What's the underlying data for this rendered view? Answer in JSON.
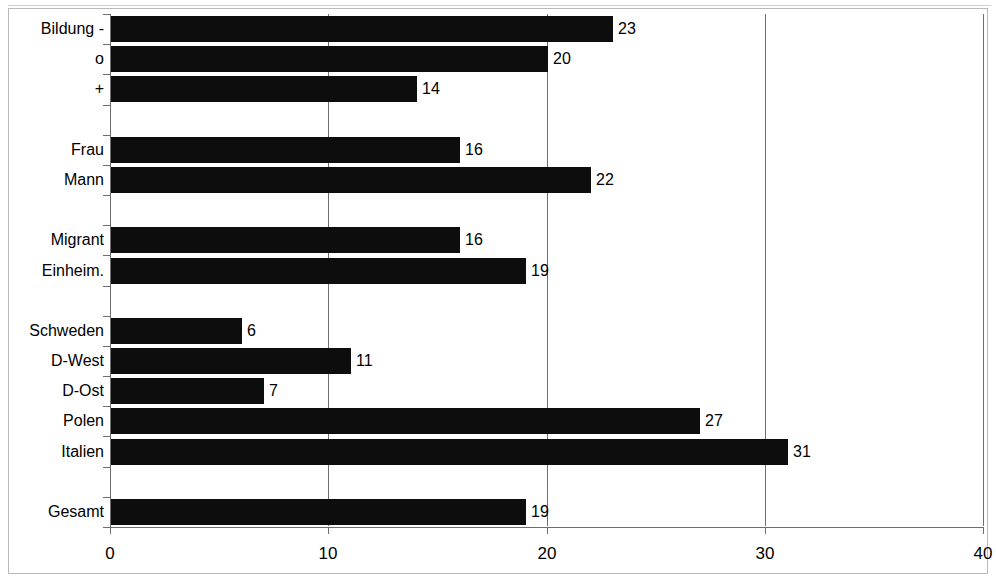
{
  "chart_data": {
    "type": "bar",
    "orientation": "horizontal",
    "title": "",
    "subtitle": "",
    "xlabel": "",
    "ylabel": "",
    "xlim": [
      0,
      40
    ],
    "xticks": [
      "0",
      "10",
      "20",
      "30",
      "40"
    ],
    "xtick_values": [
      0,
      10,
      20,
      30,
      40
    ],
    "grid": "vertical",
    "legend": "none",
    "bar_color": "#0d0d0d",
    "categories": [
      "Bildung -",
      "o",
      "+",
      "",
      "Frau",
      "Mann",
      "",
      "Migrant",
      "Einheim.",
      "",
      "Schweden",
      "D-West",
      "D-Ost",
      "Polen",
      "Italien",
      "",
      "Gesamt"
    ],
    "values": [
      23,
      20,
      14,
      null,
      16,
      22,
      null,
      16,
      19,
      null,
      6,
      11,
      7,
      27,
      31,
      null,
      19
    ],
    "data_labels": [
      "23",
      "20",
      "14",
      "",
      "16",
      "22",
      "",
      "16",
      "19",
      "",
      "6",
      "11",
      "7",
      "27",
      "31",
      "",
      "19"
    ],
    "groups": [
      {
        "name": "Bildung",
        "categories": [
          "Bildung -",
          "o",
          "+"
        ],
        "values": [
          23,
          20,
          14
        ]
      },
      {
        "name": "Geschlecht",
        "categories": [
          "Frau",
          "Mann"
        ],
        "values": [
          16,
          22
        ]
      },
      {
        "name": "Herkunft",
        "categories": [
          "Migrant",
          "Einheim."
        ],
        "values": [
          16,
          19
        ]
      },
      {
        "name": "Land",
        "categories": [
          "Schweden",
          "D-West",
          "D-Ost",
          "Polen",
          "Italien"
        ],
        "values": [
          6,
          11,
          7,
          27,
          31
        ]
      },
      {
        "name": "Gesamt",
        "categories": [
          "Gesamt"
        ],
        "values": [
          19
        ]
      }
    ]
  }
}
